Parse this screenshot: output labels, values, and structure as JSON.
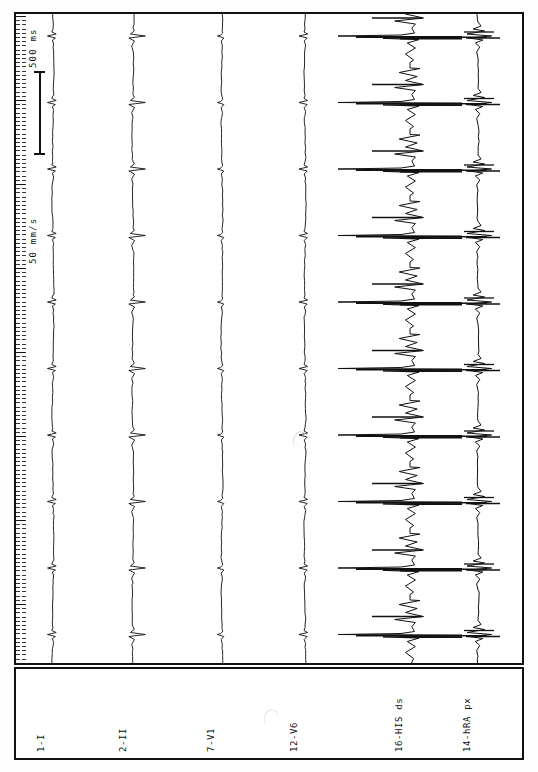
{
  "recording": {
    "kind": "intracardiac-electrophysiology-strip",
    "orientation": "rotated-90",
    "paper_speed": "50 mm/s",
    "time_scale_label": "500 ms",
    "background_color": "#ffffff",
    "trace_color": "#111111",
    "frame_color": "#111111"
  },
  "channels": [
    {
      "id": "ch1",
      "label": "1-I",
      "type": "surface-ecg"
    },
    {
      "id": "ch2",
      "label": "2-II",
      "type": "surface-ecg"
    },
    {
      "id": "ch3",
      "label": "7-V1",
      "type": "surface-ecg"
    },
    {
      "id": "ch4",
      "label": "12-V6",
      "type": "surface-ecg"
    },
    {
      "id": "ch5",
      "label": "16-HIS ds",
      "type": "intracardiac"
    },
    {
      "id": "ch6",
      "label": "14-hRA px",
      "type": "intracardiac"
    }
  ],
  "annotations": {
    "speed": "50 mm/s",
    "duration": "500 ms"
  },
  "chart_data": {
    "type": "line",
    "title": "",
    "xlabel": "",
    "ylabel": "",
    "grid": false,
    "legend": "none",
    "orientation": "vertical-time-axis",
    "time_axis": {
      "label": "time",
      "unit": "ms",
      "scale_bar_ms": 500,
      "paper_speed": "50 mm/s"
    },
    "beats": {
      "count": 11,
      "comment": "QRS complexes evenly spaced along the time (vertical) axis",
      "time_positions_px": [
        88,
        172,
        238,
        304,
        370,
        437,
        513,
        580,
        640,
        90,
        176
      ]
    },
    "series": [
      {
        "name": "1-I",
        "baseline_px": 53,
        "amplitude_scale": 1.0,
        "qrs_times_px": [
          88,
          172,
          238,
          304,
          370,
          437,
          513,
          580,
          640
        ],
        "morphology": "small biphasic QRS, low amplitude"
      },
      {
        "name": "2-II",
        "baseline_px": 133,
        "amplitude_scale": 1.3,
        "qrs_times_px": [
          88,
          172,
          238,
          304,
          370,
          437,
          513,
          580,
          640
        ],
        "morphology": "sharp negative QRS deflection"
      },
      {
        "name": "7-V1",
        "baseline_px": 222,
        "amplitude_scale": 0.9,
        "qrs_times_px": [
          88,
          172,
          238,
          304,
          370,
          437,
          513,
          580,
          640
        ],
        "morphology": "small positive spike"
      },
      {
        "name": "12-V6",
        "baseline_px": 305,
        "amplitude_scale": 1.0,
        "qrs_times_px": [
          88,
          172,
          238,
          304,
          370,
          437,
          513,
          580,
          640
        ],
        "morphology": "small biphasic deflection"
      },
      {
        "name": "16-HIS ds",
        "baseline_px": 410,
        "amplitude_scale": 4.5,
        "qrs_times_px": [
          88,
          172,
          238,
          304,
          370,
          437,
          513,
          580,
          640
        ],
        "morphology": "very large sharp His bundle electrograms with atrial, His and ventricular components"
      },
      {
        "name": "14-hRA px",
        "baseline_px": 478,
        "amplitude_scale": 2.2,
        "qrs_times_px": [
          88,
          172,
          238,
          304,
          370,
          437,
          513,
          580,
          640
        ],
        "morphology": "sharp bipolar high right atrial electrograms"
      }
    ]
  }
}
